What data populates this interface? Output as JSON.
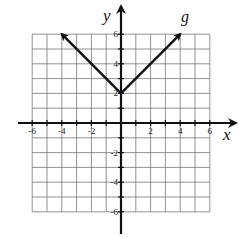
{
  "chart_data": {
    "type": "line",
    "title": "",
    "xlabel": "x",
    "ylabel": "y",
    "xlim": [
      -6,
      6
    ],
    "ylim": [
      -6,
      6
    ],
    "grid": true,
    "x_ticks": [
      -6,
      -4,
      -2,
      2,
      4,
      6
    ],
    "y_ticks": [
      -6,
      -4,
      -2,
      2,
      4,
      6
    ],
    "x_tick_labels": [
      "-6",
      "-4",
      "-2",
      "2",
      "4",
      "6"
    ],
    "y_tick_labels": [
      "-6",
      "-4",
      "-2",
      "2",
      "4",
      "6"
    ],
    "series": [
      {
        "name": "g",
        "equation": "g(x) = |x| + 2",
        "x": [
          -4,
          0,
          4
        ],
        "y": [
          6,
          2,
          6
        ],
        "arrows_at_ends": true
      }
    ],
    "annotations": [
      {
        "text": "g",
        "x": 4.3,
        "y": 6.6
      }
    ]
  },
  "labels": {
    "x_axis": "x",
    "y_axis": "y",
    "function": "g"
  }
}
